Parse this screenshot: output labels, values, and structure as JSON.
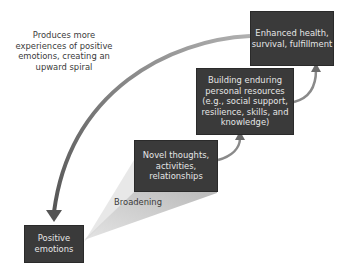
{
  "diagram": {
    "type": "broaden-and-build upward spiral",
    "nodes": [
      {
        "id": "positive",
        "label": "Positive\nemotions"
      },
      {
        "id": "novel",
        "label": "Novel thoughts,\nactivities,\nrelationships"
      },
      {
        "id": "building",
        "label": "Building enduring\npersonal resources\n(e.g., social support,\nresilience, skills, and\nknowledge)"
      },
      {
        "id": "enhanced",
        "label": "Enhanced health,\nsurvival, fulfillment"
      }
    ],
    "edges": [
      {
        "from": "positive",
        "to": "novel",
        "label": "Broadening",
        "style": "wedge"
      },
      {
        "from": "novel",
        "to": "building",
        "style": "curved-arrow"
      },
      {
        "from": "building",
        "to": "enhanced",
        "style": "curved-arrow"
      },
      {
        "from": "enhanced",
        "to": "positive",
        "label": "Produces more\nexperiences of positive\nemotions, creating an\nupward spiral",
        "style": "large-curved-arrow"
      }
    ],
    "labels": {
      "feedback": "Produces more\nexperiences of positive\nemotions, creating an\nupward spiral",
      "broadening": "Broadening"
    },
    "colors": {
      "box_fill": "#3a3a3a",
      "box_text": "#e6e6e6",
      "arrow": "#7a7a7a",
      "wedge": "#c8c8c8",
      "label_text": "#3a3a3a"
    }
  }
}
